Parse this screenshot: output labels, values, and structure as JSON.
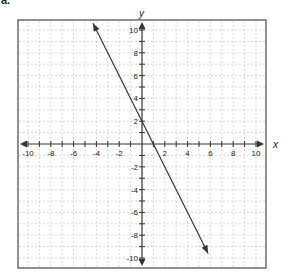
{
  "part_label": "a.",
  "chart_data": {
    "type": "line",
    "title": "",
    "xlabel": "x",
    "ylabel": "y",
    "xlim": [
      -10,
      10
    ],
    "ylim": [
      -10,
      10
    ],
    "grid": true,
    "grid_style": "dashed",
    "x_ticks": [
      -10,
      -8,
      -6,
      -4,
      -2,
      2,
      4,
      6,
      8,
      10
    ],
    "y_ticks": [
      -10,
      -8,
      -6,
      -4,
      -2,
      2,
      4,
      6,
      8,
      10
    ],
    "x_tick_labels": [
      "-10",
      "-8",
      "-6",
      "-4",
      "-2",
      "2",
      "4",
      "6",
      "8",
      "10"
    ],
    "y_tick_labels": [
      "-10",
      "-8",
      "-6",
      "-4",
      "-2",
      "2",
      "4",
      "6",
      "8",
      "10"
    ],
    "series": [
      {
        "name": "line",
        "equation": "y = -2x + 2",
        "slope": -2,
        "intercept": 2,
        "x": [
          -4.3,
          5.8
        ],
        "y": [
          10.6,
          -9.6
        ],
        "arrows_both_ends": true
      }
    ],
    "colors": {
      "axis": "#333333",
      "grid": "#c8c8c8",
      "line": "#333333",
      "frame": "#555555"
    }
  }
}
